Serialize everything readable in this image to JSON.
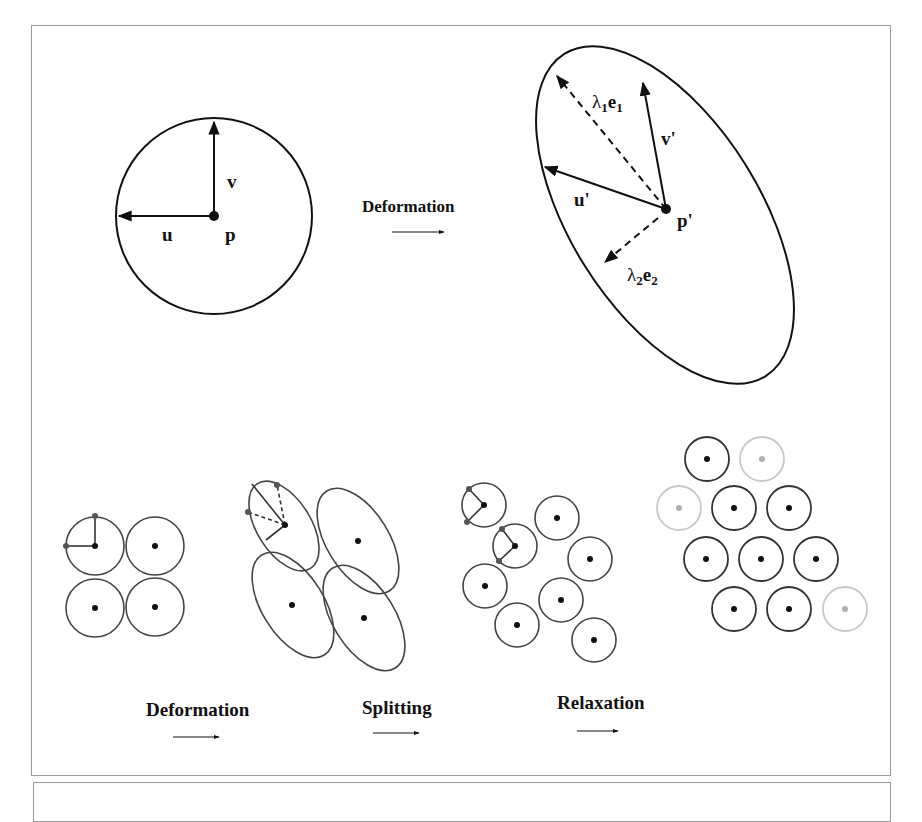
{
  "top_diagram": {
    "before": {
      "point_label": "p",
      "vector_u_label": "u",
      "vector_v_label": "v"
    },
    "transition_label": "Deformation",
    "after": {
      "point_label": "p'",
      "vector_u_label": "u'",
      "vector_v_label": "v'",
      "eigen1_lambda": "λ",
      "eigen1_lambda_sub": "1",
      "eigen1_e": "e",
      "eigen1_e_sub": "1",
      "eigen2_lambda": "λ",
      "eigen2_lambda_sub": "2",
      "eigen2_e": "e",
      "eigen2_e_sub": "2"
    }
  },
  "bottom_diagram": {
    "steps": [
      {
        "label": "Deformation"
      },
      {
        "label": "Splitting"
      },
      {
        "label": "Relaxation"
      }
    ]
  },
  "colors": {
    "stroke": "#111111",
    "faded_stroke": "#c8c8c8",
    "faded_dot": "#b0b0b0",
    "marker_dot": "#555555",
    "frame": "#9a9a9a"
  }
}
